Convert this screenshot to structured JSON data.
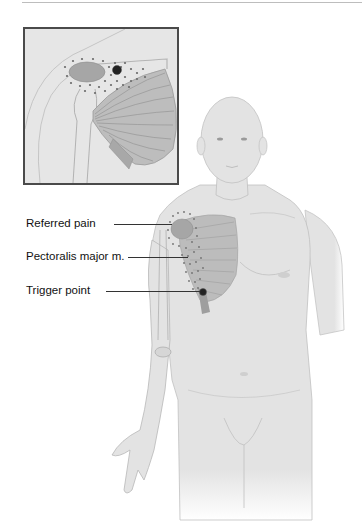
{
  "figure": {
    "inset_view": "Close-up of right shoulder and pectoralis major muscle",
    "labels": [
      {
        "id": "referred-pain",
        "text": "Referred pain"
      },
      {
        "id": "pectoralis-major",
        "text": "Pectoralis major m."
      },
      {
        "id": "trigger-point",
        "text": "Trigger point"
      }
    ]
  },
  "colors": {
    "skin": "#e3e3e3",
    "outline": "#b5b5b5",
    "muscle": "#b8b8b8",
    "muscle_fiber": "#8f8f8f",
    "referred_pain_area": "#a9a9a9",
    "dots": "#6a6a6a",
    "trigger_point": "#222222",
    "inset_border": "#4a4a4a",
    "label_text": "#111111"
  }
}
